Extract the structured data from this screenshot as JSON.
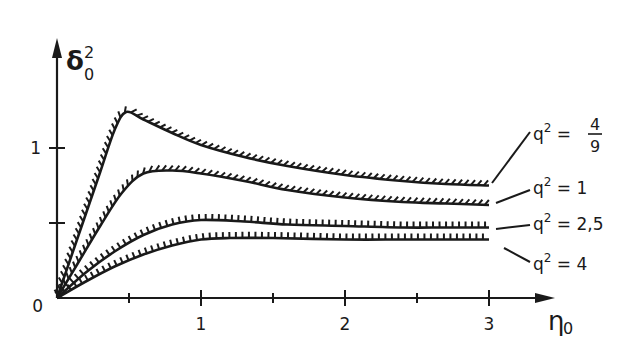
{
  "chart_data": {
    "type": "line",
    "title": "",
    "xlabel": "η₀",
    "ylabel": "δ₀²",
    "xlim": [
      0,
      3.4
    ],
    "ylim": [
      0,
      1.6
    ],
    "x_ticks": [
      {
        "value": 0.5,
        "label": ""
      },
      {
        "value": 1,
        "label": "1"
      },
      {
        "value": 1.5,
        "label": ""
      },
      {
        "value": 2,
        "label": "2"
      },
      {
        "value": 2.5,
        "label": ""
      },
      {
        "value": 3,
        "label": "3"
      }
    ],
    "y_ticks": [
      {
        "value": 0.5,
        "label": ""
      },
      {
        "value": 1,
        "label": "1"
      }
    ],
    "origin_label": "0",
    "grid": false,
    "legend_position": "right (inline labels)",
    "series": [
      {
        "name": "q² = 4/9",
        "label_main": "q² =",
        "label_num": "4",
        "label_den": "9",
        "x": [
          0,
          0.1,
          0.2,
          0.3,
          0.4,
          0.48,
          0.6,
          0.8,
          1.0,
          1.3,
          1.6,
          2.0,
          2.4,
          2.7,
          3.0
        ],
        "y": [
          0,
          0.28,
          0.56,
          0.84,
          1.12,
          1.24,
          1.19,
          1.1,
          1.02,
          0.94,
          0.88,
          0.82,
          0.78,
          0.76,
          0.75
        ],
        "hatch": "slanted"
      },
      {
        "name": "q² = 1",
        "label_main": "q² = 1",
        "x": [
          0,
          0.15,
          0.3,
          0.45,
          0.6,
          0.8,
          1.0,
          1.3,
          1.6,
          2.0,
          2.4,
          2.7,
          3.0
        ],
        "y": [
          0,
          0.24,
          0.48,
          0.7,
          0.83,
          0.85,
          0.83,
          0.78,
          0.72,
          0.67,
          0.64,
          0.63,
          0.62
        ],
        "hatch": "slanted"
      },
      {
        "name": "q² = 2,5",
        "label_main": "q² = 2,5",
        "x": [
          0,
          0.2,
          0.4,
          0.6,
          0.8,
          1.0,
          1.3,
          1.6,
          2.0,
          2.4,
          2.7,
          3.0
        ],
        "y": [
          0,
          0.17,
          0.31,
          0.42,
          0.49,
          0.52,
          0.51,
          0.49,
          0.48,
          0.47,
          0.47,
          0.47
        ],
        "hatch": "vertical"
      },
      {
        "name": "q² = 4",
        "label_main": "q² = 4",
        "x": [
          0,
          0.2,
          0.4,
          0.6,
          0.8,
          1.0,
          1.2,
          1.5,
          2.0,
          2.4,
          2.7,
          3.0
        ],
        "y": [
          0,
          0.11,
          0.21,
          0.29,
          0.35,
          0.39,
          0.4,
          0.4,
          0.39,
          0.39,
          0.39,
          0.39
        ],
        "hatch": "vertical"
      }
    ]
  },
  "colors": {
    "ink": "#1a1a1a",
    "background": "#ffffff"
  }
}
